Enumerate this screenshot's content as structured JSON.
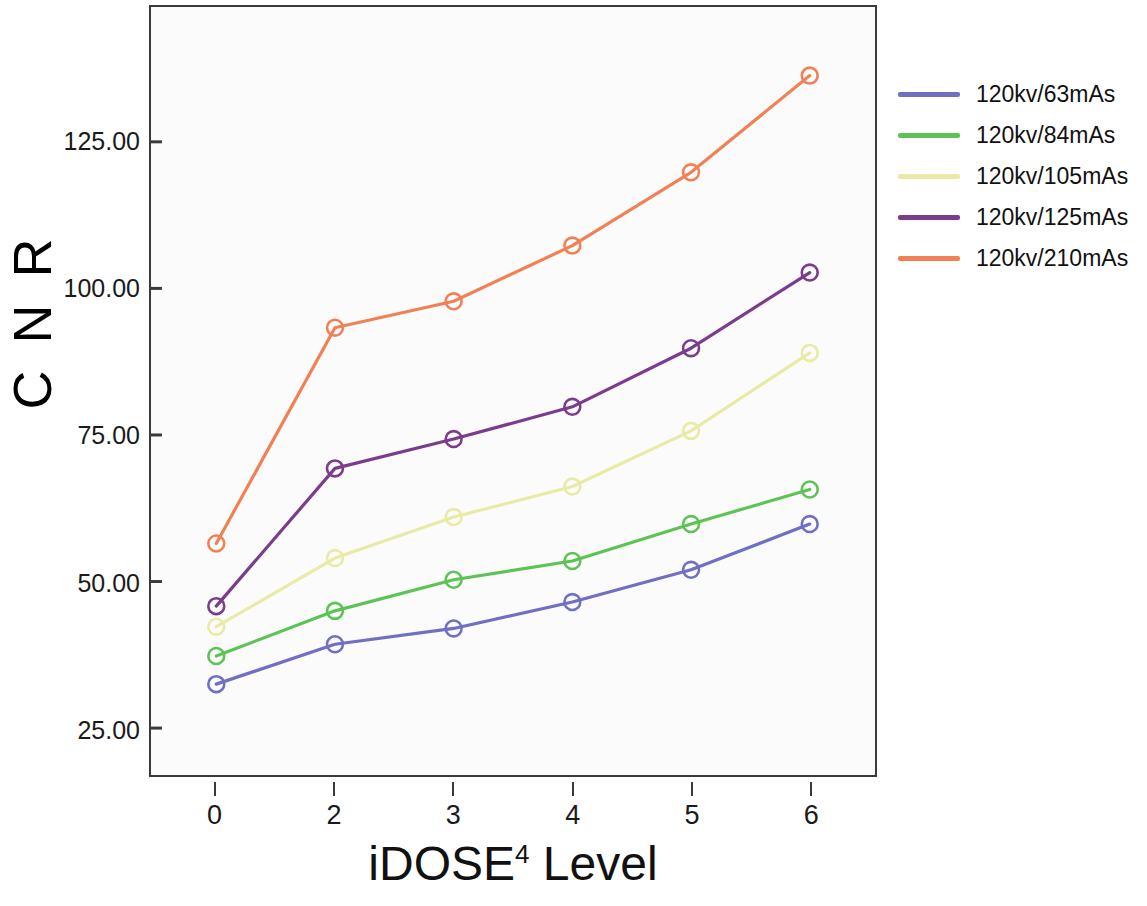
{
  "chart_data": {
    "type": "line",
    "title": "",
    "xlabel": "iDOSE4 Level",
    "xlabel_base": "iDOSE",
    "xlabel_sup": "4",
    "xlabel_tail": " Level",
    "ylabel": "C N R",
    "categories": [
      "0",
      "2",
      "3",
      "4",
      "5",
      "6"
    ],
    "xtick_labels": [
      "0",
      "2",
      "3",
      "4",
      "5",
      "6"
    ],
    "ytick_labels": [
      "25.00",
      "50.00",
      "75.00",
      "100.00",
      "125.00"
    ],
    "ytick_values": [
      25,
      50,
      75,
      100,
      125
    ],
    "ylim": [
      17,
      148
    ],
    "xlim": [
      -0.55,
      5.55
    ],
    "grid": false,
    "legend_position": "right",
    "marker": "circle-open",
    "series": [
      {
        "name": "120kv/63mAs",
        "color": "#6f6fc4",
        "values": [
          32.5,
          39.3,
          42.0,
          46.5,
          52.0,
          59.8
        ]
      },
      {
        "name": "120kv/84mAs",
        "color": "#5cc354",
        "values": [
          37.3,
          45.0,
          50.3,
          53.5,
          59.8,
          65.7
        ]
      },
      {
        "name": "120kv/105mAs",
        "color": "#e9eaa6",
        "values": [
          42.3,
          54.0,
          61.0,
          66.2,
          75.7,
          89.0
        ]
      },
      {
        "name": "120kv/125mAs",
        "color": "#7b3c8c",
        "values": [
          45.8,
          69.3,
          74.3,
          79.8,
          89.8,
          102.7
        ]
      },
      {
        "name": "120kv/210mAs",
        "color": "#f28055",
        "values": [
          56.5,
          93.3,
          97.8,
          107.3,
          119.8,
          136.3
        ]
      }
    ]
  },
  "legend": {
    "items": [
      {
        "label": "120kv/63mAs",
        "color": "#6f6fc4"
      },
      {
        "label": "120kv/84mAs",
        "color": "#5cc354"
      },
      {
        "label": "120kv/105mAs",
        "color": "#e9eaa6"
      },
      {
        "label": "120kv/125mAs",
        "color": "#7b3c8c"
      },
      {
        "label": "120kv/210mAs",
        "color": "#f28055"
      }
    ]
  },
  "axes": {
    "plot_background": "#fbfbfb",
    "border_color": "#3a3a3a"
  }
}
